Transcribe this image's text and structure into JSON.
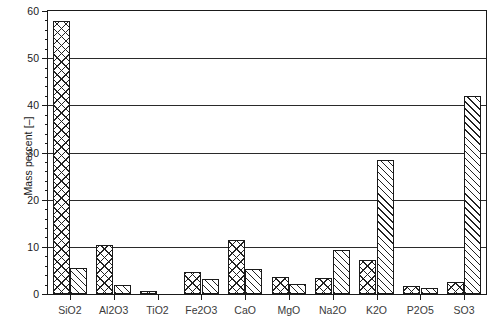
{
  "chart_data": {
    "type": "bar",
    "title": "",
    "xlabel": "",
    "ylabel": "Mass percent [–]",
    "ylim": [
      0,
      60
    ],
    "ytick_labels": [
      "0",
      "10",
      "20",
      "30",
      "40",
      "50",
      "60"
    ],
    "ytick_values": [
      0,
      10,
      20,
      30,
      40,
      50,
      60
    ],
    "ytick_minor_step": 2,
    "grid": "horizontal",
    "legend": "none",
    "categories": [
      "SiO2",
      "Al2O3",
      "TiO2",
      "Fe2O3",
      "CaO",
      "MgO",
      "Na2O",
      "K2O",
      "P2O5",
      "SO3"
    ],
    "series": [
      {
        "name": "series-1",
        "pattern": "cross-hatch",
        "values": [
          57.8,
          10.3,
          0.7,
          4.6,
          11.4,
          3.6,
          3.5,
          7.3,
          1.8,
          2.5
        ]
      },
      {
        "name": "series-2",
        "pattern": "diagonal-hatch",
        "values": [
          5.6,
          2.0,
          0.0,
          3.2,
          5.4,
          2.1,
          9.3,
          28.5,
          1.2,
          42.0
        ]
      }
    ],
    "colors": {
      "axis": "#1a1a1a",
      "grid": "#2a2a2a",
      "bar_edge": "#1a1a1a",
      "bar_fill": "#ffffff",
      "background": "#ffffff"
    }
  }
}
